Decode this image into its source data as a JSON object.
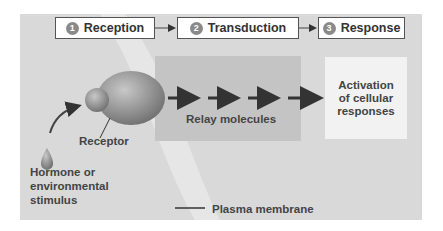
{
  "steps": [
    {
      "number": "1",
      "label": "Reception"
    },
    {
      "number": "2",
      "label": "Transduction"
    },
    {
      "number": "3",
      "label": "Response"
    }
  ],
  "labels": {
    "receptor": "Receptor",
    "relay": "Relay molecules",
    "stimulus_line1": "Hormone or",
    "stimulus_line2": "environmental",
    "stimulus_line3": "stimulus",
    "membrane": "Plasma membrane"
  },
  "response": {
    "line1": "Activation",
    "line2": "of cellular",
    "line3": "responses"
  },
  "colors": {
    "background": "#d9d9d9",
    "relay_box": "#c4c4c4",
    "receptor": "#888888",
    "arrow": "#333333"
  }
}
